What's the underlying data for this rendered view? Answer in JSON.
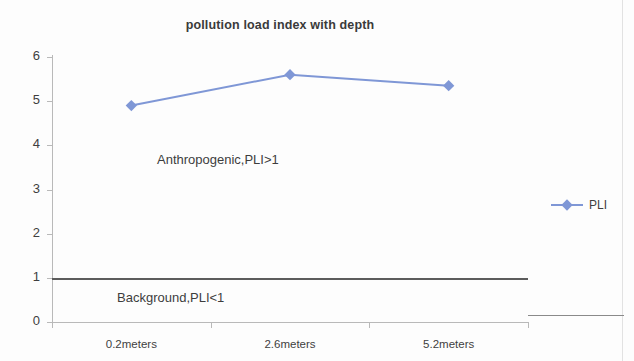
{
  "chart_data": {
    "type": "line",
    "title": "pollution load index with depth",
    "xlabel": "",
    "ylabel": "",
    "categories": [
      "0.2meters",
      "2.6meters",
      "5.2meters"
    ],
    "series": [
      {
        "name": "PLI",
        "values": [
          4.9,
          5.6,
          5.35
        ],
        "color": "#7f97d6"
      }
    ],
    "ylim": [
      0,
      6
    ],
    "yticks": [
      0,
      1,
      2,
      3,
      4,
      5,
      6
    ],
    "ytick_labels": [
      "0",
      "1",
      "2",
      "3",
      "4",
      "5",
      "6"
    ],
    "grid": false,
    "legend_position": "right",
    "legend": [
      {
        "label": "PLI",
        "color": "#7f97d6",
        "marker": "diamond"
      }
    ],
    "reference_lines": [
      {
        "value": 1,
        "color": "#5c5c5c",
        "label": ""
      }
    ],
    "annotations": [
      {
        "id": "anthropogenic",
        "text": "Anthropogenic,PLI>1"
      },
      {
        "id": "background",
        "text": "Background,PLI<1"
      }
    ]
  },
  "colors": {
    "series": "#7f97d6",
    "axis": "#b9b9b9",
    "threshold": "#5c5c5c",
    "text": "#3f3f3f",
    "background": "#fdfdfd"
  }
}
